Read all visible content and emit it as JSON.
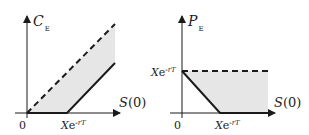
{
  "left_chart": {
    "y_label": "C",
    "y_label_sub": "E",
    "x_label": "S(0)",
    "origin_label": "0",
    "x_tick_label_main": "X",
    "x_tick_label_e": "e",
    "x_tick_label_exp": "-rT",
    "upper_bound": "dashed line C = S(0)",
    "lower_bound": "solid line max(S(0) - Xe^{-rT}, 0)"
  },
  "right_chart": {
    "y_label": "P",
    "y_label_sub": "E",
    "x_label": "S(0)",
    "origin_label": "0",
    "y_tick_label_main": "X",
    "y_tick_label_e": "e",
    "y_tick_label_exp": "-rT",
    "x_tick_label_main": "X",
    "x_tick_label_e": "e",
    "x_tick_label_exp": "-rT",
    "upper_bound": "dashed line P = Xe^{-rT}",
    "lower_bound": "solid line max(Xe^{-rT} - S(0), 0)"
  },
  "colors": {
    "line": "#1a1a1a",
    "shade": "#e6e6e6"
  }
}
